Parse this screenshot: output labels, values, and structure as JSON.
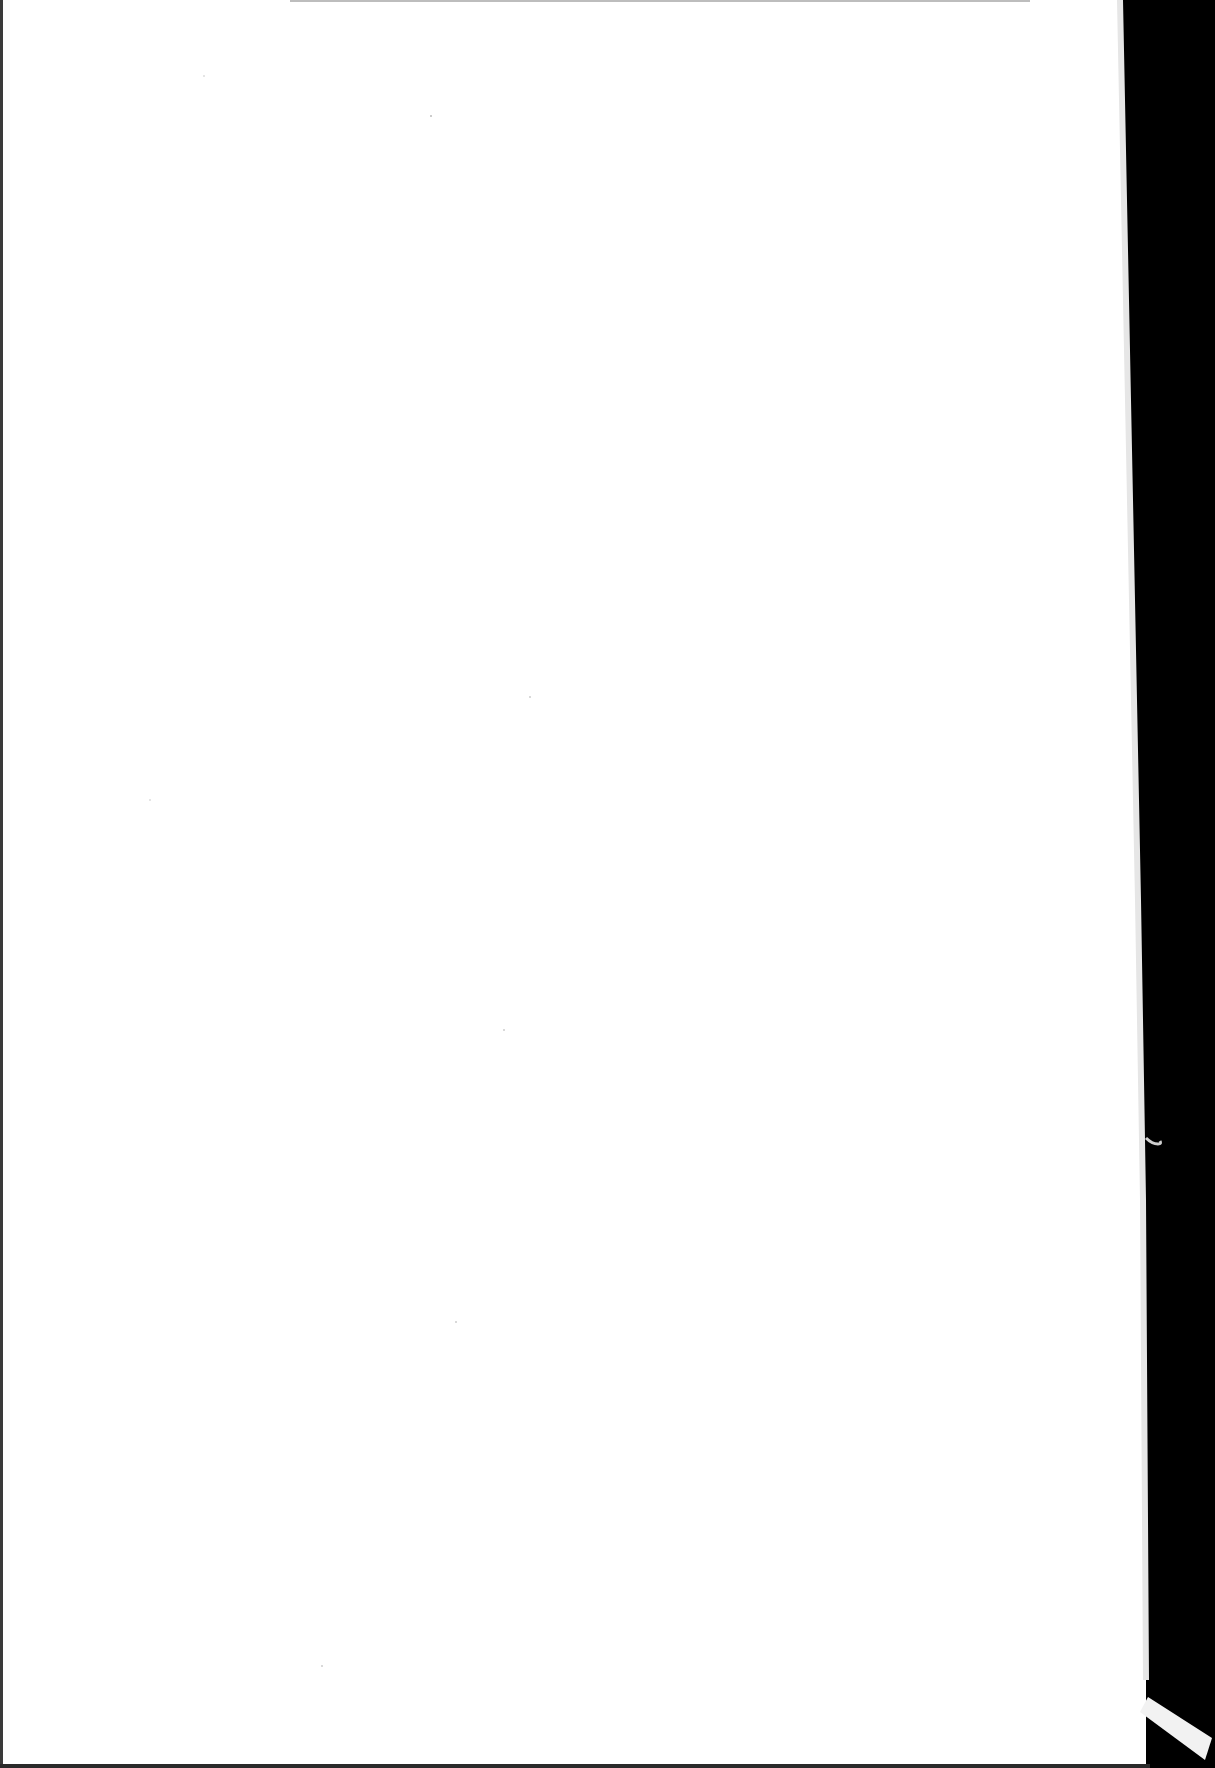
{
  "document": {
    "type": "scanned-page",
    "content": "",
    "page_color": "#ffffff",
    "background_color": "#000000",
    "border_color": "#333333"
  }
}
